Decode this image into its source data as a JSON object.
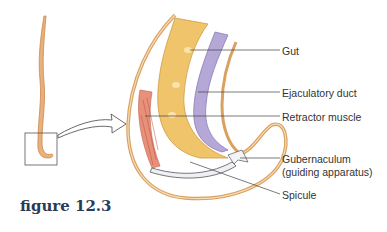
{
  "figure": {
    "caption": "figure 12.3",
    "labels": {
      "gut": "Gut",
      "ejaculatory_duct": "Ejaculatory duct",
      "retractor_muscle": "Retractor muscle",
      "gubernaculum_line1": "Gubernaculum",
      "gubernaculum_line2": "(guiding apparatus)",
      "spicule": "Spicule"
    },
    "colors": {
      "body_outline": "#d9a060",
      "gut": "#f0c46a",
      "duct": "#b5a8d6",
      "muscle": "#e07a5f",
      "caption": "#2c3a55"
    }
  }
}
